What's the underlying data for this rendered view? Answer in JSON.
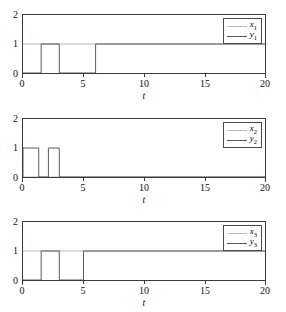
{
  "figure": {
    "subplot_count": 3,
    "colors": {
      "x_series": "#b9b9b9",
      "y_series": "#5a5a5a",
      "axis": "#3a3a3a",
      "background": "#ffffff"
    }
  },
  "chart_data": [
    {
      "type": "line",
      "title": "",
      "xlabel": "t",
      "ylabel": "",
      "xlim": [
        0,
        20
      ],
      "ylim": [
        0,
        2
      ],
      "xticks": [
        0,
        5,
        10,
        15,
        20
      ],
      "xticklabels": [
        "0",
        "5",
        "10",
        "15",
        "20"
      ],
      "yticks": [
        0,
        1,
        2
      ],
      "yticklabels": [
        "0",
        "1",
        "2"
      ],
      "grid": false,
      "legend_position": "upper right",
      "series": [
        {
          "name": "x1",
          "label_base": "x",
          "label_sub": "1",
          "color": "#b9b9b9",
          "points": [
            [
              0,
              1
            ],
            [
              20,
              1
            ]
          ]
        },
        {
          "name": "y1",
          "label_base": "y",
          "label_sub": "1",
          "color": "#5a5a5a",
          "points": [
            [
              0,
              0
            ],
            [
              1.5,
              0
            ],
            [
              1.5,
              1
            ],
            [
              3.0,
              1
            ],
            [
              3.0,
              0
            ],
            [
              6.0,
              0
            ],
            [
              6.0,
              1
            ],
            [
              20,
              1
            ]
          ]
        }
      ]
    },
    {
      "type": "line",
      "title": "",
      "xlabel": "t",
      "ylabel": "",
      "xlim": [
        0,
        20
      ],
      "ylim": [
        0,
        2
      ],
      "xticks": [
        0,
        5,
        10,
        15,
        20
      ],
      "xticklabels": [
        "0",
        "5",
        "10",
        "15",
        "20"
      ],
      "yticks": [
        0,
        1,
        2
      ],
      "yticklabels": [
        "0",
        "1",
        "2"
      ],
      "grid": false,
      "legend_position": "upper right",
      "series": [
        {
          "name": "x2",
          "label_base": "x",
          "label_sub": "2",
          "color": "#b9b9b9",
          "points": [
            [
              0,
              0
            ],
            [
              20,
              0
            ]
          ]
        },
        {
          "name": "y2",
          "label_base": "y",
          "label_sub": "2",
          "color": "#5a5a5a",
          "points": [
            [
              0,
              0
            ],
            [
              0,
              1
            ],
            [
              1.3,
              1
            ],
            [
              1.3,
              0
            ],
            [
              2.1,
              0
            ],
            [
              2.1,
              1
            ],
            [
              3.0,
              1
            ],
            [
              3.0,
              0
            ],
            [
              20,
              0
            ]
          ]
        }
      ]
    },
    {
      "type": "line",
      "title": "",
      "xlabel": "t",
      "ylabel": "",
      "xlim": [
        0,
        20
      ],
      "ylim": [
        0,
        2
      ],
      "xticks": [
        0,
        5,
        10,
        15,
        20
      ],
      "xticklabels": [
        "0",
        "5",
        "10",
        "15",
        "20"
      ],
      "yticks": [
        0,
        1,
        2
      ],
      "yticklabels": [
        "0",
        "1",
        "2"
      ],
      "grid": false,
      "legend_position": "upper right",
      "series": [
        {
          "name": "x3",
          "label_base": "x",
          "label_sub": "3",
          "color": "#b9b9b9",
          "points": [
            [
              0,
              1
            ],
            [
              20,
              1
            ]
          ]
        },
        {
          "name": "y3",
          "label_base": "y",
          "label_sub": "3",
          "color": "#5a5a5a",
          "points": [
            [
              0,
              0
            ],
            [
              1.5,
              0
            ],
            [
              1.5,
              1
            ],
            [
              3.0,
              1
            ],
            [
              3.0,
              0
            ],
            [
              5.0,
              0
            ],
            [
              5.0,
              1
            ],
            [
              20,
              1
            ]
          ]
        }
      ]
    }
  ],
  "subplots": [
    {
      "yticklabels": {
        "t0": "0",
        "t1": "1",
        "t2": "2"
      },
      "xticklabels": {
        "t0": "0",
        "t5": "5",
        "t10": "10",
        "t15": "15",
        "t20": "20"
      },
      "axis_title": "t",
      "legend": {
        "x_label_base": "x",
        "x_label_sub": "1",
        "y_label_base": "y",
        "y_label_sub": "1"
      }
    },
    {
      "yticklabels": {
        "t0": "0",
        "t1": "1",
        "t2": "2"
      },
      "xticklabels": {
        "t0": "0",
        "t5": "5",
        "t10": "10",
        "t15": "15",
        "t20": "20"
      },
      "axis_title": "t",
      "legend": {
        "x_label_base": "x",
        "x_label_sub": "2",
        "y_label_base": "y",
        "y_label_sub": "2"
      }
    },
    {
      "yticklabels": {
        "t0": "0",
        "t1": "1",
        "t2": "2"
      },
      "xticklabels": {
        "t0": "0",
        "t5": "5",
        "t10": "10",
        "t15": "15",
        "t20": "20"
      },
      "axis_title": "t",
      "legend": {
        "x_label_base": "x",
        "x_label_sub": "3",
        "y_label_base": "y",
        "y_label_sub": "3"
      }
    }
  ]
}
